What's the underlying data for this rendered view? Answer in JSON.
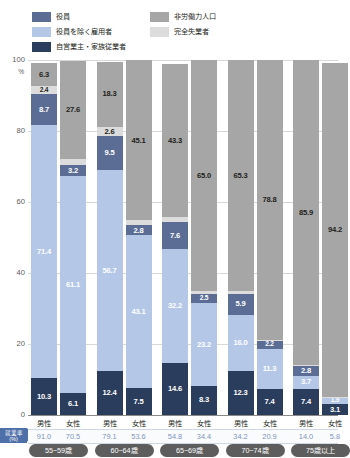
{
  "legend": {
    "items": [
      {
        "label": "役員",
        "color": "#5b6d95",
        "icon": "legend-swatch-officers",
        "column": "left"
      },
      {
        "label": "役員を除く雇用者",
        "color": "#b4c7e7",
        "icon": "legend-swatch-employees",
        "column": "left"
      },
      {
        "label": "自営業主・家族従業者",
        "color": "#2b3d5c",
        "icon": "legend-swatch-self-employed",
        "column": "left"
      },
      {
        "label": "非労働力人口",
        "color": "#a6a6a6",
        "icon": "legend-swatch-non-labor-force",
        "column": "right"
      },
      {
        "label": "完全失業者",
        "color": "#dcdcdc",
        "icon": "legend-swatch-unemployed",
        "column": "right"
      }
    ]
  },
  "yaxis": {
    "ticks": [
      "100",
      "80",
      "60",
      "40",
      "20",
      "0"
    ],
    "unit": "%"
  },
  "rate_label": {
    "line1": "就業率",
    "line2": "(%)"
  },
  "chart_data": {
    "type": "bar",
    "title": "",
    "xlabel": "",
    "ylabel": "%",
    "ylim": [
      0,
      100
    ],
    "grid": true,
    "stacked": true,
    "legend_position": "top",
    "series": [
      {
        "name": "自営業主・家族従業者",
        "color": "#2b3d5c",
        "values": [
          10.3,
          6.1,
          12.4,
          7.5,
          14.6,
          8.3,
          12.3,
          7.4,
          7.4,
          3.1
        ]
      },
      {
        "name": "役員を除く雇用者",
        "color": "#b4c7e7",
        "values": [
          71.4,
          61.1,
          56.7,
          43.1,
          32.2,
          23.2,
          16.0,
          11.3,
          3.7,
          1.9
        ]
      },
      {
        "name": "役員",
        "color": "#5b6d95",
        "values": [
          8.7,
          3.2,
          9.5,
          2.8,
          7.6,
          2.5,
          5.9,
          2.2,
          2.8,
          0.0
        ]
      },
      {
        "name": "完全失業者",
        "color": "#dcdcdc",
        "values": [
          2.4,
          1.8,
          2.6,
          1.4,
          1.3,
          0.9,
          0.6,
          0.3,
          0.2,
          0.1
        ]
      },
      {
        "name": "非労働力人口",
        "color": "#a6a6a6",
        "values": [
          6.3,
          27.6,
          18.3,
          45.1,
          43.3,
          65.0,
          65.3,
          78.8,
          85.9,
          94.2
        ]
      }
    ],
    "labels": {
      "自営業主・家族従業者": [
        "10.3",
        "6.1",
        "12.4",
        "7.5",
        "14.6",
        "8.3",
        "12.3",
        "7.4",
        "7.4",
        "3.1"
      ],
      "役員を除く雇用者": [
        "71.4",
        "61.1",
        "56.7",
        "43.1",
        "32.2",
        "23.2",
        "16.0",
        "11.3",
        "3.7",
        "1.9"
      ],
      "役員": [
        "8.7",
        "3.2",
        "9.5",
        "2.8",
        "7.6",
        "2.5",
        "5.9",
        "2.2",
        "2.8",
        ""
      ],
      "完全失業者": [
        "2.4",
        "",
        "2.6",
        "",
        "",
        "",
        "",
        "",
        "",
        ""
      ],
      "非労働力人口": [
        "6.3",
        "27.6",
        "18.3",
        "45.1",
        "43.3",
        "65.0",
        "65.3",
        "78.8",
        "85.9",
        "94.2"
      ]
    },
    "categories": [
      "男性",
      "女性",
      "男性",
      "女性",
      "男性",
      "女性",
      "男性",
      "女性",
      "男性",
      "女性"
    ],
    "age_groups": [
      "55~59歳",
      "60~64歳",
      "65~69歳",
      "70~74歳",
      "75歳以上"
    ],
    "employment_rate": [
      "91.0",
      "70.5",
      "79.1",
      "53.6",
      "54.8",
      "34.4",
      "34.2",
      "20.9",
      "14.0",
      "5.8"
    ]
  }
}
